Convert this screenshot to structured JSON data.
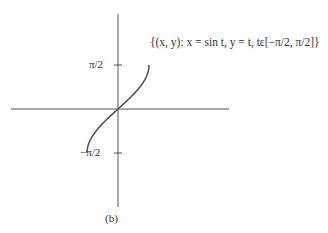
{
  "figure": {
    "set_notation": "{(x, y): x = sin t, y = t, tε[−π/2, π/2]}",
    "caption": "(b)",
    "y_tick_top": "π/2",
    "y_tick_bottom": "−π/2",
    "colors": {
      "stroke": "#555555",
      "text": "#333333",
      "background": "#ffffff"
    }
  },
  "chart_data": {
    "type": "line",
    "title": "{(x, y): x = sin t, y = t, tε[−π/2, π/2]}",
    "xlabel": "",
    "ylabel": "",
    "ytick_labels": [
      "−π/2",
      "π/2"
    ],
    "series": [
      {
        "name": "x = sin t, y = t",
        "x": [
          -1.0,
          -0.951,
          -0.809,
          -0.588,
          -0.309,
          0.0,
          0.309,
          0.588,
          0.809,
          0.951,
          1.0
        ],
        "y": [
          -1.571,
          -1.257,
          -0.942,
          -0.628,
          -0.314,
          0.0,
          0.314,
          0.628,
          0.942,
          1.257,
          1.571
        ]
      }
    ],
    "grid": false,
    "legend": "none",
    "annotation": "(b)"
  }
}
